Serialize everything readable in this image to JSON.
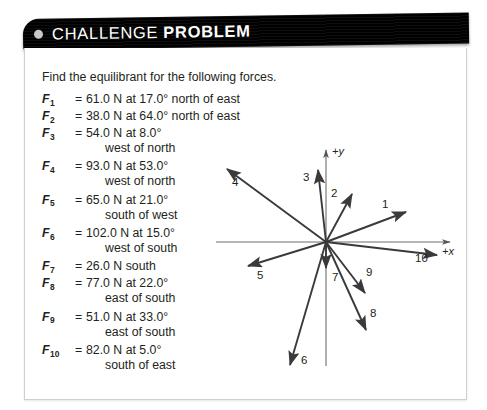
{
  "banner": {
    "title_regular": "CHALLENGE",
    "title_bold": "PROBLEM",
    "bullet": "dot-icon",
    "background_color": "#000000",
    "text_color": "#ffffff"
  },
  "problem": {
    "prompt": "Find the equilibrant for the following forces.",
    "forces": [
      {
        "index": "1",
        "symbol": "F",
        "equals": "=",
        "value": "61.0 N at 17.0° north of east",
        "cont": ""
      },
      {
        "index": "2",
        "symbol": "F",
        "equals": "=",
        "value": "38.0 N at 64.0° north of east",
        "cont": ""
      },
      {
        "index": "3",
        "symbol": "F",
        "equals": "=",
        "value": "54.0 N at 8.0°",
        "cont": "west of north"
      },
      {
        "index": "4",
        "symbol": "F",
        "equals": "=",
        "value": "93.0 N at 53.0°",
        "cont": "west of north"
      },
      {
        "index": "5",
        "symbol": "F",
        "equals": "=",
        "value": "65.0 N at 21.0°",
        "cont": "south of west"
      },
      {
        "index": "6",
        "symbol": "F",
        "equals": "=",
        "value": "102.0 N at 15.0°",
        "cont": "west of south"
      },
      {
        "index": "7",
        "symbol": "F",
        "equals": "=",
        "value": "26.0 N south",
        "cont": ""
      },
      {
        "index": "8",
        "symbol": "F",
        "equals": "=",
        "value": "77.0 N at 22.0°",
        "cont": "east of south"
      },
      {
        "index": "9",
        "symbol": "F",
        "equals": "=",
        "value": "51.0 N at 33.0°",
        "cont": "east of south"
      },
      {
        "index": "10",
        "symbol": "F",
        "equals": "=",
        "value": "82.0 N at 5.0°",
        "cont": "south of east"
      }
    ]
  },
  "chart_data": {
    "type": "scatter",
    "title": "",
    "xlabel": "+x",
    "ylabel": "+y",
    "grid": false,
    "legend": "none",
    "origin": {
      "x": 116,
      "y": 104
    },
    "axes": {
      "x_axis_label": "+x",
      "y_axis_label": "+y",
      "x_start": {
        "x": 6,
        "y": 104
      },
      "x_end": {
        "x": 240,
        "y": 104
      },
      "y_start": {
        "x": 116,
        "y": 228
      },
      "y_end": {
        "x": 116,
        "y": 12
      }
    },
    "vectors": [
      {
        "label": "1",
        "magnitude_N": 61.0,
        "direction": "17.0° north of east",
        "tip": {
          "x": 196,
          "y": 74
        },
        "label_pos": {
          "x": 172,
          "y": 70
        }
      },
      {
        "label": "2",
        "magnitude_N": 38.0,
        "direction": "64.0° north of east",
        "tip": {
          "x": 142,
          "y": 56
        },
        "label_pos": {
          "x": 121,
          "y": 59
        }
      },
      {
        "label": "3",
        "magnitude_N": 54.0,
        "direction": "8.0° west of north",
        "tip": {
          "x": 108,
          "y": 32
        },
        "label_pos": {
          "x": 93,
          "y": 43
        }
      },
      {
        "label": "4",
        "magnitude_N": 93.0,
        "direction": "53.0° west of north",
        "tip": {
          "x": 17,
          "y": 31
        },
        "label_pos": {
          "x": 22,
          "y": 48
        }
      },
      {
        "label": "5",
        "magnitude_N": 65.0,
        "direction": "21.0° south of west",
        "tip": {
          "x": 38,
          "y": 128
        },
        "label_pos": {
          "x": 47,
          "y": 141
        }
      },
      {
        "label": "6",
        "magnitude_N": 102.0,
        "direction": "15.0° west of south",
        "tip": {
          "x": 80,
          "y": 227
        },
        "label_pos": {
          "x": 91,
          "y": 226
        }
      },
      {
        "label": "7",
        "magnitude_N": 26.0,
        "direction": "south",
        "tip": {
          "x": 116,
          "y": 130
        },
        "label_pos": {
          "x": 122,
          "y": 143
        }
      },
      {
        "label": "8",
        "magnitude_N": 77.0,
        "direction": "22.0° east of south",
        "tip": {
          "x": 156,
          "y": 192
        },
        "label_pos": {
          "x": 160,
          "y": 179
        }
      },
      {
        "label": "9",
        "magnitude_N": 51.0,
        "direction": "33.0° east of south",
        "tip": {
          "x": 155,
          "y": 155
        },
        "label_pos": {
          "x": 156,
          "y": 138
        }
      },
      {
        "label": "10",
        "magnitude_N": 82.0,
        "direction": "5.0° south of east",
        "tip": {
          "x": 227,
          "y": 117
        },
        "label_pos": {
          "x": 205,
          "y": 124
        }
      }
    ]
  }
}
